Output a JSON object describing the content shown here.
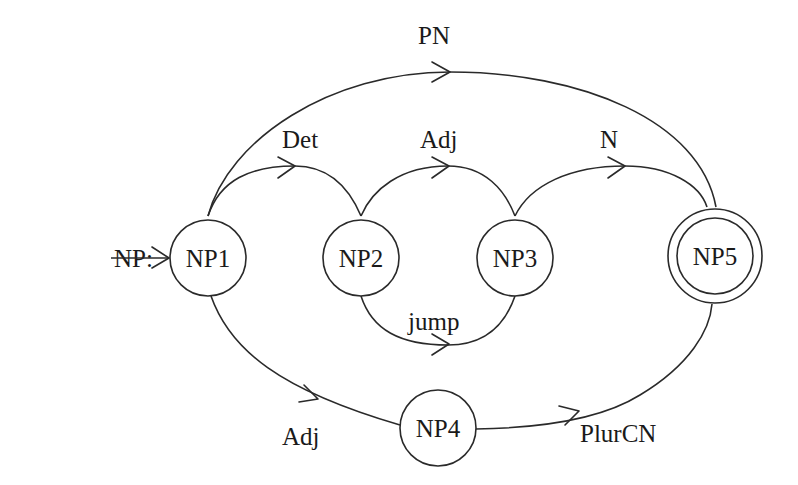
{
  "diagram": {
    "type": "augmented transition network",
    "network_label": "NP:",
    "nodes": [
      {
        "id": "NP1",
        "label": "NP1",
        "role": "start"
      },
      {
        "id": "NP2",
        "label": "NP2"
      },
      {
        "id": "NP3",
        "label": "NP3"
      },
      {
        "id": "NP4",
        "label": "NP4"
      },
      {
        "id": "NP5",
        "label": "NP5",
        "role": "final"
      }
    ],
    "edges": [
      {
        "from": "NP1",
        "to": "NP5",
        "label": "PN"
      },
      {
        "from": "NP1",
        "to": "NP2",
        "label": "Det"
      },
      {
        "from": "NP2",
        "to": "NP3",
        "label": "Adj"
      },
      {
        "from": "NP3",
        "to": "NP5",
        "label": "N"
      },
      {
        "from": "NP2",
        "to": "NP3",
        "label": "jump"
      },
      {
        "from": "NP1",
        "to": "NP4",
        "label": "Adj"
      },
      {
        "from": "NP4",
        "to": "NP5",
        "label": "PlurCN"
      }
    ]
  }
}
